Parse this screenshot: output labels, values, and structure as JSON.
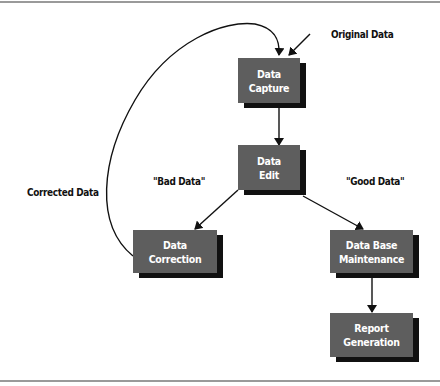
{
  "diagram": {
    "type": "flowchart",
    "colors": {
      "box_fill": "#5e5e5e",
      "box_shadow": "#111111",
      "box_text": "#ffffff",
      "line": "#111111",
      "frame": "#9a9a9a"
    },
    "nodes": {
      "capture": {
        "line1": "Data",
        "line2": "Capture"
      },
      "edit": {
        "line1": "Data",
        "line2": "Edit"
      },
      "correction": {
        "line1": "Data",
        "line2": "Correction"
      },
      "maintenance": {
        "line1": "Data Base",
        "line2": "Maintenance"
      },
      "report": {
        "line1": "Report",
        "line2": "Generation"
      }
    },
    "labels": {
      "original": "Original Data",
      "corrected": "Corrected Data",
      "bad": "\"Bad Data\"",
      "good": "\"Good Data\""
    },
    "edges": [
      {
        "from": "Original Data",
        "to": "Data Capture"
      },
      {
        "from": "Data Capture",
        "to": "Data Edit"
      },
      {
        "from": "Data Edit",
        "to": "Data Correction",
        "label": "\"Bad Data\""
      },
      {
        "from": "Data Edit",
        "to": "Data Base Maintenance",
        "label": "\"Good Data\""
      },
      {
        "from": "Data Base Maintenance",
        "to": "Report Generation"
      },
      {
        "from": "Data Correction",
        "to": "Data Capture",
        "label": "Corrected Data"
      }
    ]
  }
}
